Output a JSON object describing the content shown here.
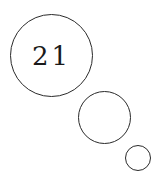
{
  "thought_bubble": {
    "text": "21",
    "bubbles": [
      "large",
      "medium",
      "small"
    ],
    "stroke_color": "#2a2a2a",
    "background": "#ffffff"
  }
}
